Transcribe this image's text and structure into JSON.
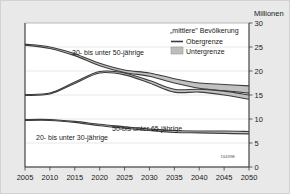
{
  "chart_data": {
    "type": "area",
    "title": "",
    "subtitle": "",
    "xlabel": "",
    "ylabel": "Millionen",
    "unit_label": "Millionen",
    "grid": true,
    "legend_position": "top-right",
    "x": [
      2005,
      2010,
      2015,
      2020,
      2025,
      2030,
      2035,
      2040,
      2045,
      2050
    ],
    "xticklabels": [
      "2005",
      "2010",
      "2015",
      "2020",
      "2025",
      "2030",
      "2035",
      "2040",
      "2045",
      "2050"
    ],
    "xlim": [
      2005,
      2050
    ],
    "ylim": [
      0,
      30
    ],
    "yticks": [
      0,
      5,
      10,
      15,
      20,
      25,
      30
    ],
    "yticklabels": [
      "0",
      "5",
      "10",
      "15",
      "20",
      "25",
      "30"
    ],
    "source_code": "16439E",
    "series": [
      {
        "name": "30- bis unter 50-jährige",
        "label": "30- bis unter 50-jährige",
        "upper_name": "Obergrenze",
        "lower_name": "Untergrenze",
        "upper": [
          25.6,
          25.0,
          23.6,
          21.6,
          20.2,
          19.6,
          18.4,
          17.5,
          17.2,
          16.9
        ],
        "lower": [
          25.4,
          24.7,
          23.2,
          21.1,
          19.7,
          18.9,
          17.5,
          16.4,
          15.9,
          15.4
        ]
      },
      {
        "name": "50- bis unter 65-jährige",
        "label": "50-bis unter 65-jährige",
        "upper_name": "Obergrenze",
        "lower_name": "Untergrenze",
        "upper": [
          15.1,
          15.4,
          17.7,
          19.9,
          19.6,
          18.0,
          16.2,
          16.2,
          15.8,
          15.0
        ],
        "lower": [
          14.9,
          15.2,
          17.4,
          19.6,
          19.2,
          17.5,
          15.6,
          15.6,
          15.0,
          14.1
        ]
      },
      {
        "name": "20- bis unter 30-jährige",
        "label": "20- bis unter 30-jährige",
        "upper_name": "Obergrenze",
        "lower_name": "Untergrenze",
        "upper": [
          9.9,
          9.9,
          9.5,
          8.9,
          8.4,
          7.9,
          7.6,
          7.5,
          7.5,
          7.4
        ],
        "lower": [
          9.7,
          9.7,
          9.3,
          8.6,
          8.1,
          7.6,
          7.2,
          7.1,
          7.0,
          6.9
        ]
      }
    ]
  },
  "legend": {
    "title": "„mittlere\" Bevölkerung",
    "items": [
      {
        "label": "Obergrenze",
        "swatch": "line"
      },
      {
        "label": "Untergrenze",
        "swatch": "box"
      }
    ]
  },
  "colors": {
    "background": "#e9e9e9",
    "plot_background": "#ffffff",
    "band_fill": "#b6b6b6",
    "band_edge": "#3c3c3c",
    "gridline": "#cfcfcf",
    "axis": "#3a3a3a",
    "text": "#1a1a1a"
  }
}
